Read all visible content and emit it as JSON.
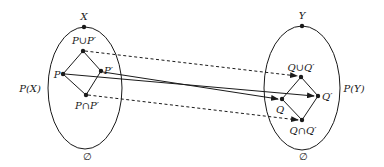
{
  "diagram": {
    "left_set": {
      "top_label": "X",
      "side_label": "P(X)",
      "bottom_label": "∅",
      "nodes": {
        "join": "P∪P′",
        "p": "P",
        "p_prime": "P′",
        "meet": "P∩P′"
      }
    },
    "right_set": {
      "top_label": "Y",
      "side_label": "P(Y)",
      "bottom_label": "∅",
      "nodes": {
        "join": "Q∪Q′",
        "q": "Q",
        "q_prime": "Q′",
        "meet": "Q∩Q′"
      }
    },
    "mappings": [
      {
        "from": "P∪P′",
        "to": "Q∪Q′",
        "style": "dashed"
      },
      {
        "from": "P",
        "to": "Q′",
        "style": "solid"
      },
      {
        "from": "P′",
        "to": "Q",
        "style": "solid"
      },
      {
        "from": "P∩P′",
        "to": "Q∩Q′",
        "style": "dashed"
      }
    ],
    "colors": {
      "stroke": "#1a1a1a",
      "background": "#ffffff"
    }
  }
}
